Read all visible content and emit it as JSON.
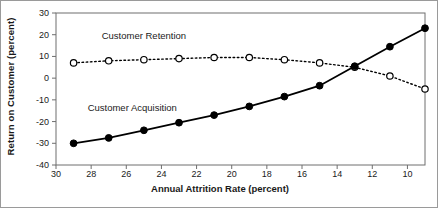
{
  "chart_data": {
    "type": "line",
    "title": "",
    "xlabel": "Annual Attrition Rate (percent)",
    "ylabel": "Return on Customer (percent)",
    "xlim": [
      30,
      9
    ],
    "ylim": [
      -40,
      30
    ],
    "x_ticks": [
      30,
      28,
      26,
      24,
      22,
      20,
      18,
      16,
      14,
      12,
      10
    ],
    "y_ticks": [
      30,
      20,
      10,
      0,
      -10,
      -20,
      -30,
      -40
    ],
    "x_axis_reversed": true,
    "grid": false,
    "legend_position": "inline-annotation",
    "x": [
      29,
      27,
      25,
      23,
      21,
      19,
      17,
      15,
      13,
      11,
      9
    ],
    "series": [
      {
        "name": "Customer Retention",
        "marker": "open-circle",
        "line_style": "dotted",
        "color": "#000000",
        "values": [
          7,
          8,
          8.5,
          9,
          9.5,
          9.5,
          8.5,
          7,
          5,
          1,
          -5
        ]
      },
      {
        "name": "Customer Acquisition",
        "marker": "filled-circle",
        "line_style": "solid",
        "color": "#000000",
        "values": [
          -30,
          -27.5,
          -24,
          -20.5,
          -17,
          -13,
          -8.5,
          -3.5,
          5.5,
          14.5,
          23
        ]
      }
    ],
    "annotations": [
      {
        "text": "Customer Retention",
        "x": 27.4,
        "y": 19
      },
      {
        "text": "Customer Acquisition",
        "x": 28.2,
        "y": -14
      }
    ]
  }
}
